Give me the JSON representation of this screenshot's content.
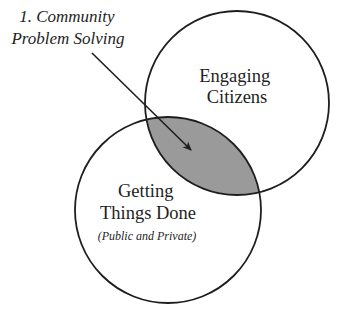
{
  "diagram": {
    "type": "venn",
    "callout": {
      "line1": "1. Community",
      "line2": "Problem Solving",
      "points_to": "intersection"
    },
    "circles": [
      {
        "id": "engaging-citizens",
        "line1": "Engaging",
        "line2": "Citizens",
        "cx": 237,
        "cy": 103,
        "r": 92
      },
      {
        "id": "getting-things-done",
        "line1": "Getting",
        "line2": "Things Done",
        "subtitle": "(Public and Private)",
        "cx": 168,
        "cy": 210,
        "r": 93
      }
    ],
    "colors": {
      "stroke": "#1e1e1e",
      "intersection_fill": "#9a9a9a",
      "background": "#ffffff"
    }
  }
}
